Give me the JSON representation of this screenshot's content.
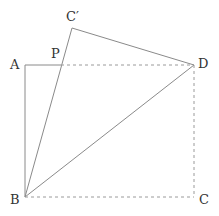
{
  "diagram": {
    "type": "geometry-folded-rectangle",
    "points": {
      "A": {
        "label": "A",
        "x": 25,
        "y": 65
      },
      "P": {
        "label": "P",
        "x": 61,
        "y": 65
      },
      "D": {
        "label": "D",
        "x": 194,
        "y": 65
      },
      "C_prime": {
        "label": "C′",
        "x": 72,
        "y": 28
      },
      "B": {
        "label": "B",
        "x": 25,
        "y": 197
      },
      "C": {
        "label": "C",
        "x": 194,
        "y": 197
      }
    },
    "solid_segments": [
      "AP",
      "AB",
      "BD",
      "BC′",
      "C′D"
    ],
    "dashed_segments": [
      "PD",
      "DC",
      "BC"
    ],
    "colors": {
      "line": "#8a8a8a",
      "dashed": "#9a9a9a",
      "text": "#333333"
    }
  }
}
